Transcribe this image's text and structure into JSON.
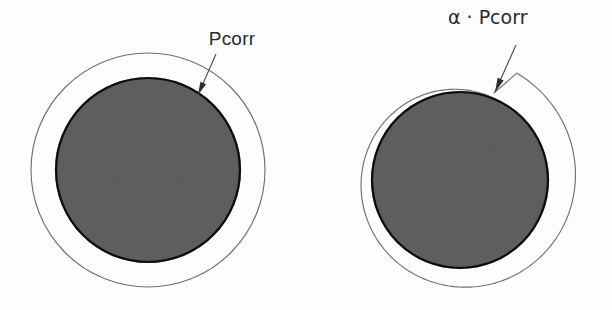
{
  "figure": {
    "caption_visible": false,
    "background_color": "#fdfdfd",
    "stroke_color": "#6f7173",
    "disc_fill_color": "#9a9b9b",
    "disc_outline_color": "#3a3a3a",
    "text_color": "#2b2b2b"
  },
  "panels": [
    {
      "id": "left",
      "name": "uniform-corrosion-panel",
      "label": "Pcorr",
      "label_x": 232,
      "label_y": 45,
      "description_visible": false,
      "disc": {
        "cx": 148,
        "cy": 170,
        "r": 92
      },
      "outer_boundary": {
        "type": "circle",
        "cx": 148,
        "cy": 170,
        "r": 117
      },
      "leader": {
        "from_x": 216,
        "from_y": 54,
        "to_x": 198,
        "to_y": 95
      }
    },
    {
      "id": "right",
      "name": "spiral-corrosion-panel",
      "label": "α · Pcorr",
      "label_x": 448,
      "label_y": 24,
      "description_visible": false,
      "disc": {
        "cx": 460,
        "cy": 180,
        "r": 88
      },
      "outer_boundary": {
        "type": "archimedean-spiral",
        "cx": 460,
        "cy": 180,
        "r_base": 88,
        "start_angle_deg": 62,
        "growth_px_per_turn": 33,
        "turns": 1,
        "direction": "counterclockwise",
        "converge_x": 494,
        "converge_y": 93
      },
      "leader": {
        "from_x": 516,
        "from_y": 45,
        "to_x": 495,
        "to_y": 92
      }
    }
  ],
  "annotations": {
    "alpha_symbol": "α",
    "middot_symbol": "·",
    "base_label": "Pcorr"
  }
}
